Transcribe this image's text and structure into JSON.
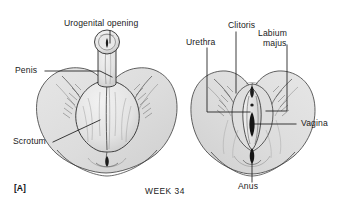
{
  "figure": {
    "panel_tag": "[A]",
    "caption": "WEEK 34",
    "background_color": "#ffffff",
    "ink_color": "#1a1a1a",
    "shading_color": "#d9d9d9"
  },
  "labels": {
    "urogenital_opening": "Urogenital opening",
    "penis": "Penis",
    "scrotum": "Scrotum",
    "urethra": "Urethra",
    "clitoris": "Clitoris",
    "labium_majus_line1": "Labium",
    "labium_majus_line2": "majus",
    "vagina": "Vagina",
    "anus": "Anus"
  },
  "panels": [
    {
      "name": "male-external-genitalia",
      "labels": [
        "Urogenital opening",
        "Penis",
        "Scrotum"
      ]
    },
    {
      "name": "female-external-genitalia",
      "labels": [
        "Urethra",
        "Clitoris",
        "Labium majus",
        "Vagina",
        "Anus"
      ]
    }
  ]
}
